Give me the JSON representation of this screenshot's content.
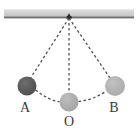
{
  "figure": {
    "background_color": "#ffffff"
  },
  "ceiling": {
    "name": "ceiling-support-bar",
    "fill_top": "#dcdcdc",
    "fill_mid": "#c9c9c9",
    "edge_color": "#6b6b6b",
    "x": 4,
    "y": 9,
    "width": 130,
    "height": 9
  },
  "pivot": {
    "name": "pivot-point",
    "label": "",
    "x": 69,
    "y": 18,
    "color": "#2e2e2e",
    "size": 3
  },
  "strings": [
    {
      "name": "string-to-a",
      "from": "pivot",
      "to": "A",
      "style": "dashed",
      "color": "#4a4a4a"
    },
    {
      "name": "string-to-o",
      "from": "pivot",
      "to": "O",
      "style": "dashed",
      "color": "#4a4a4a"
    },
    {
      "name": "string-to-b",
      "from": "pivot",
      "to": "B",
      "style": "dashed",
      "color": "#4a4a4a"
    }
  ],
  "arcs": [
    {
      "name": "arc-a-to-o",
      "from": "A",
      "to": "O",
      "style": "dashed",
      "color": "#4a4a4a"
    },
    {
      "name": "arc-o-to-b",
      "from": "O",
      "to": "B",
      "style": "dashed",
      "color": "#4a4a4a"
    }
  ],
  "balls": [
    {
      "id": "A",
      "name": "pendulum-bob-a",
      "label": "A",
      "cx": 27,
      "cy": 86,
      "r": 9.5,
      "color": "#5a5a5a",
      "label_x": 25,
      "label_y": 112
    },
    {
      "id": "O",
      "name": "pendulum-bob-o",
      "label": "O",
      "cx": 69,
      "cy": 102,
      "r": 9.5,
      "color": "#aeaeae",
      "label_x": 69,
      "label_y": 126
    },
    {
      "id": "B",
      "name": "pendulum-bob-b",
      "label": "B",
      "cx": 115,
      "cy": 86,
      "r": 10,
      "color": "#b2b2b2",
      "label_x": 114,
      "label_y": 112
    }
  ]
}
